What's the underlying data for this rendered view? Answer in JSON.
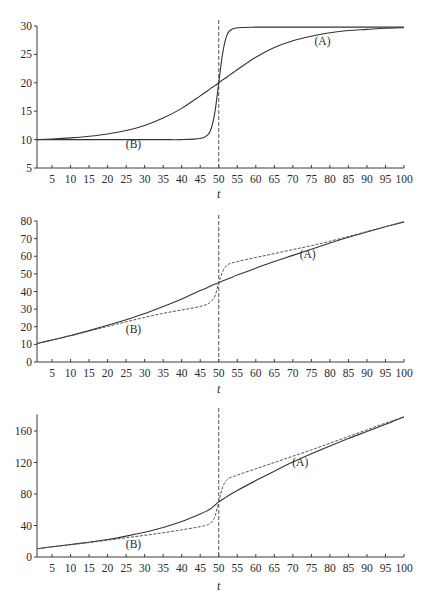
{
  "chart_data": [
    {
      "type": "line",
      "title": "",
      "xlabel": "t",
      "ylabel": "",
      "xlim": [
        1,
        100
      ],
      "ylim": [
        5,
        30
      ],
      "grid": false,
      "x_ticks": [
        5,
        10,
        15,
        20,
        25,
        30,
        35,
        40,
        45,
        50,
        55,
        60,
        65,
        70,
        75,
        80,
        85,
        90,
        95,
        100
      ],
      "y_ticks": [
        5,
        10,
        15,
        20,
        25,
        30
      ],
      "vertical_reference_line": {
        "x": 50,
        "style": "dashed"
      },
      "annotations": [
        {
          "text": "(A)",
          "x": 78,
          "y": 27.4
        },
        {
          "text": "(B)",
          "x": 27,
          "y": 9.2
        }
      ],
      "x": [
        1,
        5,
        10,
        15,
        20,
        25,
        30,
        35,
        40,
        45,
        47,
        48,
        49,
        50,
        51,
        52,
        53,
        55,
        60,
        65,
        70,
        75,
        80,
        85,
        90,
        95,
        100
      ],
      "series": [
        {
          "name": "(A)",
          "style": "solid",
          "values": [
            10.0,
            10.1,
            10.3,
            10.6,
            11.0,
            11.6,
            12.5,
            13.8,
            15.5,
            17.7,
            18.6,
            19.1,
            19.5,
            20.0,
            20.5,
            20.9,
            21.4,
            22.3,
            24.5,
            26.2,
            27.4,
            28.2,
            28.8,
            29.2,
            29.4,
            29.6,
            29.7
          ]
        },
        {
          "name": "(B)",
          "style": "solid",
          "values": [
            10.0,
            10.0,
            10.0,
            10.0,
            10.0,
            10.0,
            10.0,
            10.0,
            10.0,
            10.2,
            10.8,
            12.0,
            15.0,
            20.0,
            25.0,
            28.0,
            29.2,
            29.7,
            29.8,
            29.8,
            29.8,
            29.8,
            29.8,
            29.8,
            29.8,
            29.8,
            29.8
          ]
        }
      ]
    },
    {
      "type": "line",
      "title": "",
      "xlabel": "t",
      "ylabel": "",
      "xlim": [
        1,
        100
      ],
      "ylim": [
        0,
        80
      ],
      "grid": false,
      "x_ticks": [
        5,
        10,
        15,
        20,
        25,
        30,
        35,
        40,
        45,
        50,
        55,
        60,
        65,
        70,
        75,
        80,
        85,
        90,
        95,
        100
      ],
      "y_ticks": [
        0,
        10,
        20,
        30,
        40,
        50,
        60,
        70,
        80
      ],
      "vertical_reference_line": {
        "x": 50,
        "style": "dashed"
      },
      "annotations": [
        {
          "text": "(A)",
          "x": 74,
          "y": 61
        },
        {
          "text": "(B)",
          "x": 27,
          "y": 19
        }
      ],
      "x": [
        1,
        5,
        10,
        15,
        20,
        25,
        30,
        35,
        40,
        45,
        47,
        48,
        49,
        50,
        51,
        52,
        53,
        55,
        60,
        65,
        70,
        75,
        80,
        85,
        90,
        95,
        100
      ],
      "series": [
        {
          "name": "solid",
          "style": "solid",
          "values": [
            10.5,
            12.5,
            15.0,
            17.8,
            20.8,
            24.0,
            27.5,
            31.5,
            35.8,
            40.5,
            42.3,
            43.3,
            44.2,
            45.0,
            45.9,
            46.8,
            47.6,
            49.3,
            53.2,
            57.0,
            60.5,
            64.0,
            67.5,
            70.8,
            73.8,
            76.7,
            79.5
          ]
        },
        {
          "name": "dashed",
          "style": "dashed",
          "values": [
            10.5,
            12.4,
            14.9,
            17.5,
            20.2,
            22.8,
            25.3,
            27.6,
            29.5,
            31.5,
            33.0,
            34.5,
            37.5,
            45.0,
            51.0,
            54.5,
            55.8,
            57.0,
            59.3,
            61.5,
            63.8,
            66.0,
            68.5,
            71.2,
            74.0,
            76.8,
            79.5
          ]
        }
      ]
    },
    {
      "type": "line",
      "title": "",
      "xlabel": "t",
      "ylabel": "",
      "xlim": [
        1,
        100
      ],
      "ylim": [
        0,
        181
      ],
      "grid": false,
      "x_ticks": [
        5,
        10,
        15,
        20,
        25,
        30,
        35,
        40,
        45,
        50,
        55,
        60,
        65,
        70,
        75,
        80,
        85,
        90,
        95,
        100
      ],
      "y_ticks": [
        0,
        40,
        80,
        120,
        160
      ],
      "vertical_reference_line": {
        "x": 50,
        "style": "dashed"
      },
      "annotations": [
        {
          "text": "(A)",
          "x": 72,
          "y": 121
        },
        {
          "text": "(B)",
          "x": 27,
          "y": 17
        }
      ],
      "x": [
        1,
        5,
        10,
        15,
        20,
        25,
        30,
        35,
        40,
        45,
        47,
        48,
        49,
        50,
        51,
        52,
        53,
        55,
        60,
        65,
        70,
        75,
        80,
        85,
        90,
        95,
        100
      ],
      "series": [
        {
          "name": "solid",
          "style": "solid",
          "values": [
            10.5,
            13.0,
            15.8,
            18.8,
            22.2,
            26.5,
            31.5,
            37.5,
            45.0,
            54.5,
            59.0,
            62.0,
            66.0,
            70.0,
            73.0,
            76.0,
            79.0,
            84.5,
            97.0,
            109.0,
            120.5,
            131.0,
            141.0,
            150.5,
            159.5,
            168.5,
            178.0
          ]
        },
        {
          "name": "dashed",
          "style": "dashed",
          "values": [
            10.5,
            12.8,
            15.5,
            18.3,
            21.3,
            24.5,
            27.5,
            30.8,
            34.5,
            38.5,
            41.0,
            44.0,
            52.0,
            70.0,
            88.0,
            97.0,
            100.5,
            104.0,
            112.0,
            120.0,
            128.0,
            136.0,
            144.5,
            153.0,
            161.5,
            170.0,
            178.0
          ]
        }
      ]
    }
  ],
  "charts": [
    {
      "x_axis_title": "t",
      "label_A": "(A)",
      "label_B": "(B)"
    },
    {
      "x_axis_title": "t",
      "label_A": "(A)",
      "label_B": "(B)"
    },
    {
      "x_axis_title": "t",
      "label_A": "(A)",
      "label_B": "(B)"
    }
  ]
}
